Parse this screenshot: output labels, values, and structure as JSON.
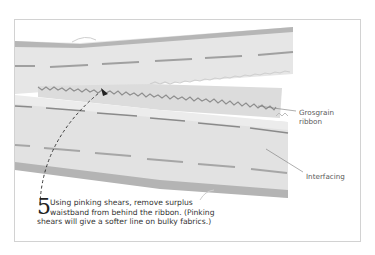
{
  "illustration": {
    "subject": "waistband with grosgrain ribbon and interfacing",
    "colors": {
      "band_fill": "#e4e4e4",
      "band_edge": "#b4b4b4",
      "stitch": "#9e9e9e",
      "ribbon_fill": "#dadada",
      "arrow": "#333333"
    }
  },
  "labels": {
    "grosgrain": [
      "Grosgrain",
      "ribbon"
    ],
    "interfacing": "Interfacing"
  },
  "caption": {
    "step_number": "5",
    "lines": [
      "Using pinking shears, remove surplus",
      "waistband from behind the ribbon. (Pinking",
      "shears will give a softer line on bulky fabrics.)"
    ]
  }
}
